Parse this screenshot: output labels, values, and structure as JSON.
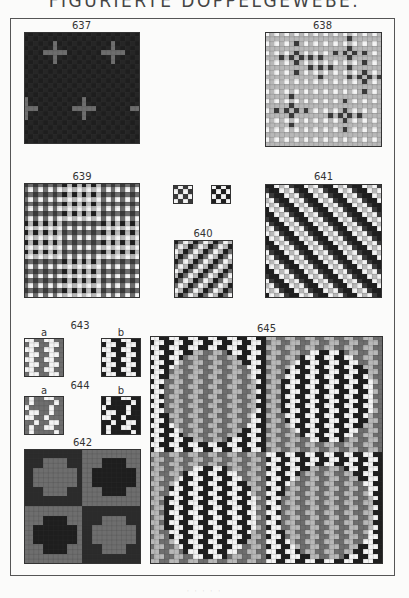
{
  "page": {
    "title": "FIGURIERTE DOPPELGEWEBE.",
    "footer": "· · · · ·"
  },
  "figures": [
    {
      "id": "637",
      "label": "637",
      "pattern": "crosses-dark"
    },
    {
      "id": "638",
      "label": "638",
      "pattern": "dots-light"
    },
    {
      "id": "639",
      "label": "639",
      "pattern": "check-mixed"
    },
    {
      "id": "640",
      "label": "640",
      "pattern": "twill-light",
      "sub_patterns": [
        "checker-a",
        "checker-b"
      ]
    },
    {
      "id": "641",
      "label": "641",
      "pattern": "twill-dark"
    },
    {
      "id": "643",
      "label": "643",
      "sub_labels": [
        "a",
        "b"
      ]
    },
    {
      "id": "644",
      "label": "644",
      "sub_labels": [
        "a",
        "b"
      ]
    },
    {
      "id": "642",
      "label": "642",
      "pattern": "cross-quadrants"
    },
    {
      "id": "645",
      "label": "645",
      "pattern": "zigzag-circles"
    }
  ],
  "colors": {
    "black": "#1e1e1e",
    "dark": "#3a3a3a",
    "mid": "#6e6e6e",
    "light": "#b8b8b8",
    "white": "#f4f4f4",
    "grid": "#8a8a8a"
  }
}
